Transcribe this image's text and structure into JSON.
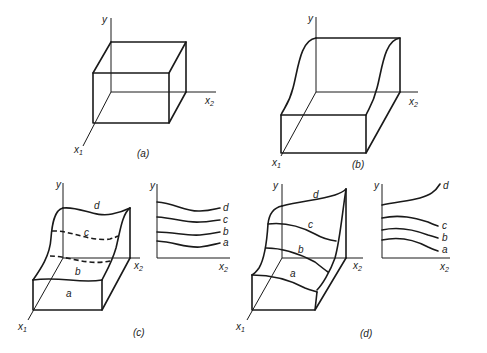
{
  "figure": {
    "panels": [
      {
        "id": "a",
        "caption": "(a)",
        "axes": {
          "y": "y",
          "x1": "x",
          "x1_sub": "1",
          "x2": "x",
          "x2_sub": "2"
        },
        "description": "rectangular box (flat top surface)"
      },
      {
        "id": "b",
        "caption": "(b)",
        "axes": {
          "y": "y",
          "x1": "x",
          "x1_sub": "1",
          "x2": "x",
          "x2_sub": "2"
        },
        "description": "box with S-shaped rising surface along x1"
      },
      {
        "id": "c",
        "caption": "(c)",
        "axes": {
          "y": "y",
          "x1": "x",
          "x1_sub": "1",
          "x2": "x",
          "x2_sub": "2"
        },
        "contours": [
          "a",
          "b",
          "c",
          "d"
        ],
        "projection": {
          "y": "y",
          "x2": "x",
          "x2_sub": "2",
          "curves": [
            "d",
            "c",
            "b",
            "a"
          ]
        }
      },
      {
        "id": "d",
        "caption": "(d)",
        "axes": {
          "y": "y",
          "x1": "x",
          "x1_sub": "1",
          "x2": "x",
          "x2_sub": "2"
        },
        "contours": [
          "a",
          "b",
          "c",
          "d"
        ],
        "projection": {
          "y": "y",
          "x2": "x",
          "x2_sub": "2",
          "curves": [
            "d",
            "c",
            "b",
            "a"
          ]
        }
      }
    ]
  }
}
